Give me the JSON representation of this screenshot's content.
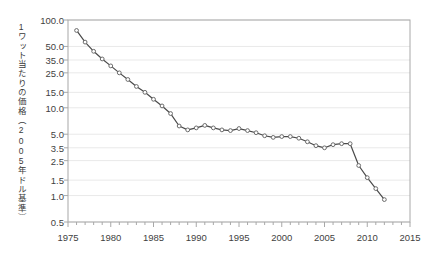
{
  "chart_data": {
    "type": "line",
    "title": "",
    "subtitle": "",
    "xlabel": "",
    "ylabel": "1ワット当たりの価格（2005年ドル基準）",
    "yscale": "log",
    "xlim": [
      1975,
      2015
    ],
    "ylim": [
      0.5,
      100.0
    ],
    "grid": true,
    "legend": "none",
    "y_tick_labels": [
      "100.0",
      "50.0",
      "35.0",
      "25.0",
      "15.0",
      "10.0",
      "5.0",
      "3.5",
      "2.5",
      "1.5",
      "1.0",
      "0.5"
    ],
    "y_tick_values": [
      100.0,
      50.0,
      35.0,
      25.0,
      15.0,
      10.0,
      5.0,
      3.5,
      2.5,
      1.5,
      1.0,
      0.5
    ],
    "x_tick_labels": [
      "1975",
      "1980",
      "1985",
      "1990",
      "1995",
      "2000",
      "2005",
      "2010",
      "2015"
    ],
    "x_tick_values": [
      1975,
      1980,
      1985,
      1990,
      1995,
      2000,
      2005,
      2010,
      2015
    ],
    "x_minor_tick_step": 1,
    "marker": "open-circle",
    "line_color": "#4a4a4a",
    "marker_color": "#6b6b6b",
    "grid_color": "#e9e9e9",
    "axis_color": "#a8a8a8",
    "background_color": "#ffffff",
    "series": [
      {
        "name": "price_per_watt",
        "x": [
          1976,
          1977,
          1978,
          1979,
          1980,
          1981,
          1982,
          1983,
          1984,
          1985,
          1986,
          1987,
          1988,
          1989,
          1990,
          1991,
          1992,
          1993,
          1994,
          1995,
          1996,
          1997,
          1998,
          1999,
          2000,
          2001,
          2002,
          2003,
          2004,
          2005,
          2006,
          2007,
          2008,
          2009,
          2010,
          2011,
          2012
        ],
        "values": [
          76.0,
          56.0,
          44.0,
          36.0,
          30.0,
          25.0,
          21.0,
          17.5,
          15.0,
          12.5,
          10.5,
          8.6,
          6.2,
          5.6,
          5.9,
          6.3,
          5.9,
          5.6,
          5.5,
          5.8,
          5.5,
          5.2,
          4.8,
          4.6,
          4.7,
          4.7,
          4.5,
          4.1,
          3.7,
          3.5,
          3.8,
          3.9,
          3.9,
          2.2,
          1.6,
          1.2,
          0.9
        ]
      }
    ]
  }
}
